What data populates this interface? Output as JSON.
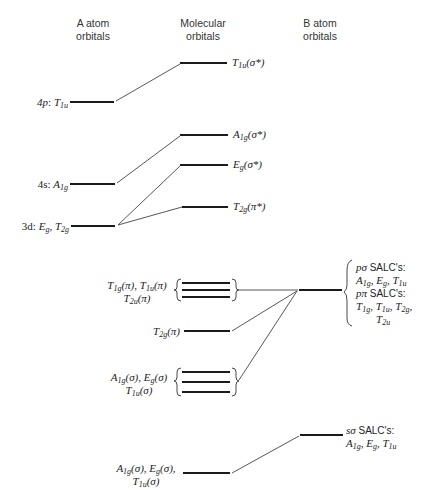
{
  "headers": {
    "a_atom": [
      "A atom",
      "orbitals"
    ],
    "molecular": [
      "Molecular",
      "orbitals"
    ],
    "b_atom": [
      "B atom",
      "orbitals"
    ]
  },
  "a_atom_levels": [
    {
      "id": "4p",
      "prefix": "4p",
      "sym": "T",
      "sub": "1u",
      "y": 102
    },
    {
      "id": "4s",
      "prefix": "4s",
      "sym": "A",
      "sub": "1g",
      "y": 184
    },
    {
      "id": "3d",
      "prefix": "3d",
      "text": "E_g, T_2g",
      "y": 226
    }
  ],
  "antibonding_mos": [
    {
      "sym": "T",
      "sub": "1u",
      "tag": "(σ*)",
      "y": 63
    },
    {
      "sym": "A",
      "sub": "1g",
      "tag": "(σ*)",
      "y": 135
    },
    {
      "sym": "E",
      "sub": "g",
      "tag": "(σ*)",
      "y": 165
    },
    {
      "sym": "T",
      "sub": "2g",
      "tag": "(π*)",
      "y": 207
    }
  ],
  "nonbonding_pi": {
    "line1": "T1g(π), T1u(π)",
    "line2": "T2u(π)",
    "levels_y": [
      283,
      290,
      297
    ]
  },
  "t2g_pi": {
    "label": "T2g(π)",
    "y": 331
  },
  "sigma_set": {
    "line1": "A1g(σ), Eg(σ)",
    "line2": "T1u(σ)",
    "levels_y": [
      372,
      382,
      392
    ]
  },
  "bonding_sigma": {
    "line1": "A1g(σ), Eg(σ),",
    "line2": "T1u(σ)",
    "y": 473
  },
  "b_atom_p": {
    "y": 290,
    "p_sigma_title": "pσ SALC's:",
    "p_sigma_syms": "A1g, Eg, T1u",
    "p_pi_title": "pπ SALC's:",
    "p_pi_syms": "T1g, T1u, T2g,",
    "p_pi_syms2": "T2u"
  },
  "b_atom_s": {
    "y": 435,
    "title": "sσ SALC's:",
    "syms": "A1g, Eg, T1u"
  },
  "colors": {
    "line": "#1a1a1a",
    "thin": "#444444"
  }
}
